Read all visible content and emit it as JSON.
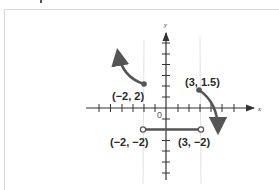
{
  "figure": {
    "axes": {
      "x_label": "x",
      "y_label": "y",
      "origin_label": "0",
      "x_ticks": [
        -6,
        -5,
        -4,
        -3,
        -2,
        -1,
        1,
        2,
        3,
        4,
        5,
        6
      ],
      "y_ticks": [
        -6,
        -5,
        -4,
        -3,
        -2,
        -1,
        1,
        2,
        3,
        4,
        5,
        6
      ]
    },
    "points": [
      {
        "label": "(−2, 2)",
        "x": -2,
        "y": 2,
        "style": "closed"
      },
      {
        "label": "(3, 1.5)",
        "x": 3,
        "y": 1.5,
        "style": "closed"
      },
      {
        "label": "(−2, −2)",
        "x": -2,
        "y": -2,
        "style": "open"
      },
      {
        "label": "(3, −2)",
        "x": 3,
        "y": -2,
        "style": "open"
      }
    ],
    "pieces": [
      {
        "name": "left-curve",
        "description": "curve from (-2,2) rising to upper-left with arrow"
      },
      {
        "name": "middle-segment",
        "description": "horizontal segment y=-2 from x=-2 to x=3, open endpoints"
      },
      {
        "name": "right-curve",
        "description": "curve from (3,1.5) falling to lower-right with arrow"
      }
    ],
    "guide_lines_x": [
      -2,
      3
    ],
    "colors": {
      "curve": "#555555",
      "axis": "#333333",
      "guide": "#e2e2e2",
      "frame": "#d9d9d9"
    }
  }
}
